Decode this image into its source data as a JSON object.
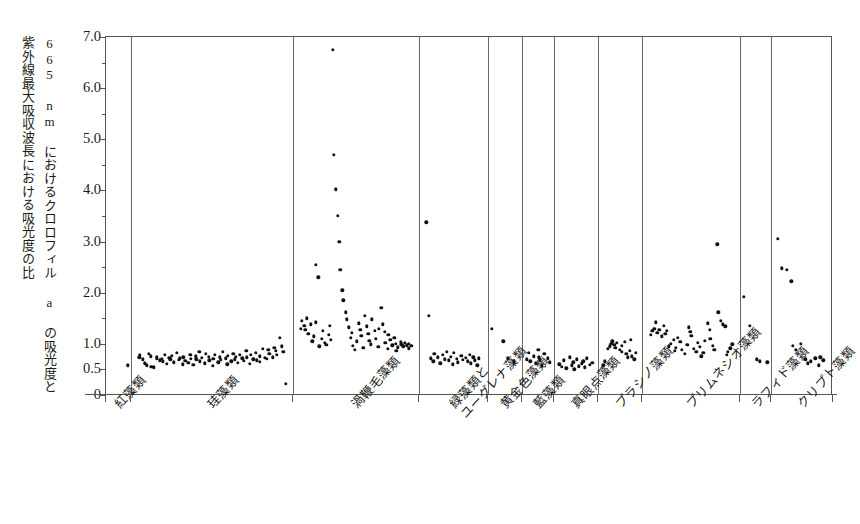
{
  "chart_data": {
    "type": "scatter",
    "title": "",
    "xlabel": "",
    "ylabel_line1": "665 nm におけるクロロフィル a の吸光度と",
    "ylabel_line2": "紫外線最大吸収波長における吸光度の比",
    "ylim": [
      0,
      7.0
    ],
    "grid": false,
    "legend": "none",
    "ytick_labels": [
      "0",
      "0.5",
      "1.0",
      "2.0",
      "3.0",
      "4.0",
      "5.0",
      "6.0",
      "7.0"
    ],
    "ytick_values": [
      0,
      0.5,
      1.0,
      2.0,
      3.0,
      4.0,
      5.0,
      6.0,
      7.0
    ],
    "yminor_values": [
      1.5,
      2.5,
      3.5,
      4.5,
      5.5,
      6.5
    ],
    "categories": [
      "紅藻類",
      "珪藻類",
      "渦鞭毛藻類",
      "緑藻類と\nユーグレナ藻類",
      "黄金色藻類",
      "藍藻類",
      "真眼点藻類",
      "プラシノ藻類",
      "プリムネシオ藻類",
      "ラフィド藻類",
      "クリプト藻類"
    ],
    "groups": [
      {
        "name": "紅藻類",
        "label_line1": "紅藻類",
        "label_line2": "",
        "x_start": 105,
        "x_end": 130,
        "values": [
          0.58
        ]
      },
      {
        "name": "珪藻類",
        "label_line1": "珪藻類",
        "label_line2": "",
        "x_start": 130,
        "x_end": 292,
        "values": [
          0.74,
          0.78,
          0.7,
          0.62,
          0.58,
          0.8,
          0.76,
          0.55,
          0.54,
          0.72,
          0.75,
          0.68,
          0.71,
          0.66,
          0.79,
          0.61,
          0.73,
          0.7,
          0.77,
          0.64,
          0.82,
          0.69,
          0.72,
          0.6,
          0.74,
          0.67,
          0.63,
          0.78,
          0.71,
          0.59,
          0.76,
          0.7,
          0.84,
          0.66,
          0.73,
          0.62,
          0.8,
          0.75,
          0.68,
          0.57,
          0.71,
          0.79,
          0.64,
          0.74,
          0.69,
          0.85,
          0.72,
          0.6,
          0.77,
          0.66,
          0.81,
          0.7,
          0.75,
          0.63,
          0.78,
          0.72,
          0.67,
          0.86,
          0.74,
          0.61,
          0.79,
          0.7,
          0.83,
          0.68,
          0.76,
          0.65,
          0.9,
          0.73,
          0.71,
          0.88,
          0.8,
          0.74,
          0.92,
          0.86,
          0.78,
          1.12,
          0.95,
          0.84,
          0.22
        ]
      },
      {
        "name": "渦鞭毛藻類",
        "label_line1": "渦鞭毛藻類",
        "label_line2": "",
        "x_start": 292,
        "x_end": 418,
        "values": [
          1.3,
          1.45,
          1.35,
          1.28,
          1.5,
          1.2,
          1.38,
          1.05,
          1.15,
          1.42,
          2.55,
          2.3,
          0.95,
          1.1,
          1.25,
          1.02,
          0.98,
          1.18,
          1.35,
          1.08,
          6.75,
          4.7,
          4.02,
          3.5,
          3.0,
          2.45,
          2.05,
          1.85,
          1.62,
          1.48,
          1.32,
          1.12,
          1.22,
          0.96,
          0.88,
          1.05,
          1.4,
          1.28,
          1.16,
          0.92,
          1.55,
          1.34,
          1.2,
          1.06,
          0.99,
          1.48,
          1.26,
          1.1,
          0.94,
          1.3,
          1.7,
          1.38,
          1.24,
          1.02,
          0.9,
          1.18,
          1.08,
          0.97,
          1.12,
          1.0,
          0.86,
          0.93,
          1.04,
          0.99,
          0.95,
          1.02,
          0.97,
          0.91,
          1.0,
          0.96
        ]
      },
      {
        "name": "緑藻類とユーグレナ藻類",
        "label_line1": "緑藻類と",
        "label_line2": "ユーグレナ藻類",
        "x_start": 418,
        "x_end": 487,
        "values": [
          3.38,
          1.55,
          0.72,
          0.66,
          0.8,
          0.74,
          0.62,
          0.78,
          0.7,
          0.85,
          0.68,
          0.75,
          0.6,
          0.82,
          0.71,
          0.64,
          0.77,
          0.69,
          0.73,
          0.66,
          0.79,
          0.62,
          0.74,
          0.68,
          0.58,
          0.72
        ]
      },
      {
        "name": "黄金色藻類",
        "label_line1": "黄金色藻類",
        "label_line2": "",
        "x_start": 487,
        "x_end": 521,
        "values": [
          1.3,
          1.05,
          0.72,
          0.66
        ]
      },
      {
        "name": "藍藻類",
        "label_line1": "藍藻類",
        "label_line2": "",
        "x_start": 521,
        "x_end": 553,
        "values": [
          0.7,
          0.82,
          0.66,
          0.76,
          0.62,
          0.88,
          0.74,
          0.68,
          0.58,
          0.8,
          0.72,
          0.64
        ]
      },
      {
        "name": "真眼点藻類",
        "label_line1": "真眼点藻類",
        "label_line2": "",
        "x_start": 553,
        "x_end": 597,
        "values": [
          0.6,
          0.55,
          0.68,
          0.52,
          0.74,
          0.58,
          0.64,
          0.5,
          0.7,
          0.56,
          0.62,
          0.66,
          0.54,
          0.72,
          0.59,
          0.63
        ]
      },
      {
        "name": "プラシノ藻類",
        "label_line1": "プラシノ藻類",
        "label_line2": "",
        "x_start": 597,
        "x_end": 641,
        "values": [
          0.58,
          0.66,
          0.9,
          0.95,
          1.0,
          1.05,
          0.98,
          0.92,
          1.02,
          0.88,
          0.84,
          0.96,
          1.04,
          0.8,
          0.74,
          0.86,
          1.08,
          0.76,
          0.7,
          0.82
        ]
      },
      {
        "name": "プリムネシオ藻類",
        "label_line1": "プリムネシオ藻類",
        "label_line2": "",
        "x_start": 641,
        "x_end": 739,
        "values": [
          1.18,
          1.25,
          1.3,
          1.42,
          1.22,
          1.28,
          1.15,
          1.35,
          1.2,
          1.26,
          0.95,
          1.0,
          1.08,
          0.86,
          0.92,
          1.12,
          1.04,
          0.88,
          0.8,
          0.98,
          1.32,
          1.24,
          1.16,
          0.9,
          0.84,
          1.02,
          0.94,
          0.76,
          0.82,
          1.06,
          1.4,
          1.28,
          1.1,
          0.96,
          0.88,
          2.95,
          1.62,
          1.45,
          1.38,
          1.34,
          0.78,
          0.85,
          0.91,
          0.99
        ]
      },
      {
        "name": "ラフィド藻類",
        "label_line1": "ラフィド藻類",
        "label_line2": "",
        "x_start": 739,
        "x_end": 770,
        "values": [
          1.92,
          1.35,
          0.7,
          0.66,
          0.64
        ]
      },
      {
        "name": "クリプト藻類",
        "label_line1": "クリプト藻類",
        "label_line2": "",
        "x_start": 770,
        "x_end": 832,
        "values": [
          3.05,
          2.48,
          2.45,
          2.22,
          0.96,
          0.88,
          1.0,
          0.7,
          0.62,
          0.66,
          0.72,
          0.58,
          0.74,
          0.68
        ]
      }
    ]
  }
}
